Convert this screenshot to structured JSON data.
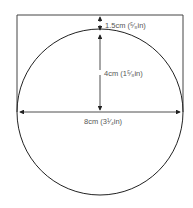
{
  "diagram": {
    "labels": {
      "top_gap": "1.5cm (⁵⁄₈in)",
      "radius": "4cm (1⁵⁄₈in)",
      "diameter": "8cm (3¹⁄₄in)"
    },
    "colors": {
      "line": "#222222",
      "text": "#555555"
    }
  }
}
